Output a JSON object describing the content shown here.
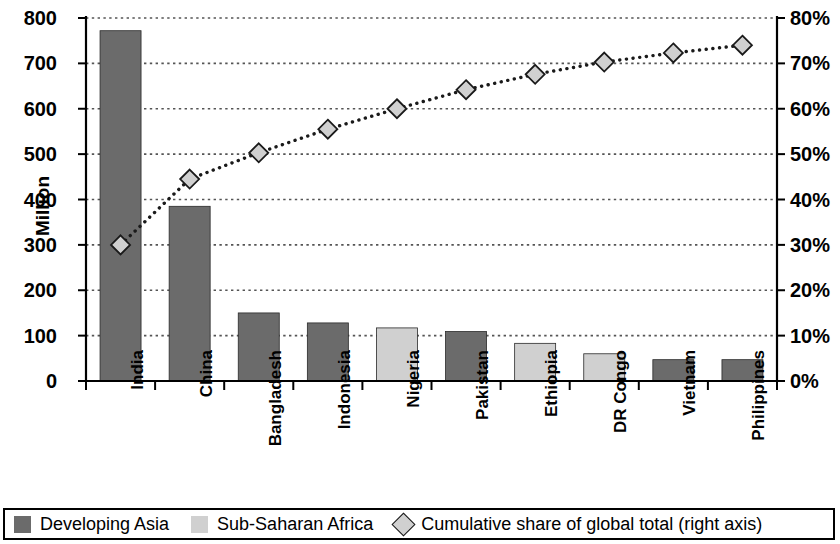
{
  "chart_data": {
    "type": "bar",
    "title": "",
    "subtitle": "",
    "xlabel": "",
    "ylabel": "Million",
    "y2label": "",
    "ylim": [
      0,
      800
    ],
    "y2lim": [
      0,
      0.8
    ],
    "grid": true,
    "legend_position": "bottom",
    "categories": [
      "India",
      "China",
      "Bangladesh",
      "Indonesia",
      "Nigeria",
      "Pakistan",
      "Ethiopia",
      "DR Congo",
      "Vietnam",
      "Philippines"
    ],
    "series": [
      {
        "name": "Developing Asia",
        "type": "bar",
        "axis": "left",
        "color": "#6b6b6b",
        "values": [
          772,
          385,
          150,
          128,
          null,
          109,
          null,
          null,
          47,
          47
        ]
      },
      {
        "name": "Sub-Saharan Africa",
        "type": "bar",
        "axis": "left",
        "color": "#d0d0d0",
        "values": [
          null,
          null,
          null,
          null,
          117,
          null,
          83,
          60,
          null,
          null
        ]
      },
      {
        "name": "Cumulative share of global total (right axis)",
        "type": "line",
        "axis": "right",
        "marker": "diamond",
        "line_style": "dotted",
        "color": "#1a1a1a",
        "marker_fill": "#d0d0d0",
        "values": [
          0.3,
          0.445,
          0.503,
          0.555,
          0.6,
          0.642,
          0.676,
          0.703,
          0.723,
          0.74
        ]
      }
    ],
    "left_axis_ticks": [
      "0",
      "100",
      "200",
      "300",
      "400",
      "500",
      "600",
      "700",
      "800"
    ],
    "left_axis_tick_values": [
      0,
      100,
      200,
      300,
      400,
      500,
      600,
      700,
      800
    ],
    "right_axis_ticks": [
      "0%",
      "10%",
      "20%",
      "30%",
      "40%",
      "50%",
      "60%",
      "70%",
      "80%"
    ],
    "right_axis_tick_values": [
      0,
      0.1,
      0.2,
      0.3,
      0.4,
      0.5,
      0.6,
      0.7,
      0.8
    ]
  },
  "legend": {
    "items": [
      {
        "label": "Developing Asia",
        "marker": "square",
        "color": "#6b6b6b"
      },
      {
        "label": "Sub-Saharan Africa",
        "marker": "square",
        "color": "#d0d0d0"
      },
      {
        "label": "Cumulative share of global total (right axis)",
        "marker": "diamond",
        "color": "#d0d0d0"
      }
    ]
  },
  "colors": {
    "developing_asia": "#6b6b6b",
    "sub_saharan_africa": "#d0d0d0",
    "axis": "#000000",
    "gridline": "#555555",
    "marker_fill": "#d0d0d0"
  }
}
